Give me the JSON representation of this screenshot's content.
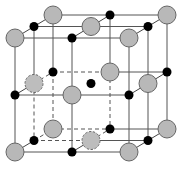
{
  "diagram": {
    "colors": {
      "background": "#ffffff",
      "large_ion": "#b8b8b8",
      "large_ion_outline": "#666666",
      "small_ion": "#000000",
      "edge": "#555555"
    },
    "geometry": {
      "front_origin": [
        15,
        38
      ],
      "cell_size": 114,
      "depth_offset": [
        38,
        -23
      ],
      "large_radius": 9,
      "small_radius": 4.5
    },
    "legend": []
  }
}
